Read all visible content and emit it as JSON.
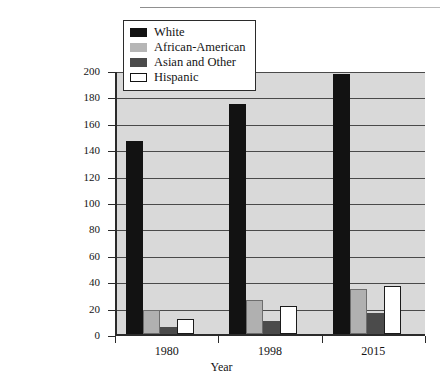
{
  "chart_data": {
    "type": "bar",
    "title": "",
    "xlabel": "Year",
    "ylabel": "Number of Employed (millions)",
    "categories": [
      "1980",
      "1998",
      "2015"
    ],
    "ylim": [
      0,
      200
    ],
    "yticks": [
      0,
      20,
      40,
      60,
      80,
      100,
      120,
      140,
      160,
      180,
      200
    ],
    "ytick_labels": [
      "0",
      "20",
      "40",
      "60",
      "80",
      "100",
      "120",
      "140",
      "160",
      "180",
      "200"
    ],
    "grid": true,
    "legend_position": "upper-left-inside",
    "series": [
      {
        "name": "White",
        "color": "#121212",
        "values": [
          146,
          174,
          197
        ]
      },
      {
        "name": "African-American",
        "color": "#b0b0b0",
        "values": [
          18,
          26,
          34
        ]
      },
      {
        "name": "Asian and Other",
        "color": "#4b4b4b",
        "values": [
          5,
          10,
          16
        ]
      },
      {
        "name": "Hispanic",
        "color": "#ffffff",
        "values": [
          11,
          21,
          36
        ]
      }
    ]
  },
  "legend": {
    "items": [
      {
        "label": "White",
        "swatch": "swatch-black"
      },
      {
        "label": "African-American",
        "swatch": "swatch-light-gray"
      },
      {
        "label": "Asian and Other",
        "swatch": "swatch-dark-gray"
      },
      {
        "label": "Hispanic",
        "swatch": "swatch-white-outline"
      }
    ]
  },
  "colors": {
    "plot_background": "#d9d9d9",
    "axis": "#2b2b2b",
    "gridline": "#4a4a4a",
    "page_background": "#ffffff"
  }
}
